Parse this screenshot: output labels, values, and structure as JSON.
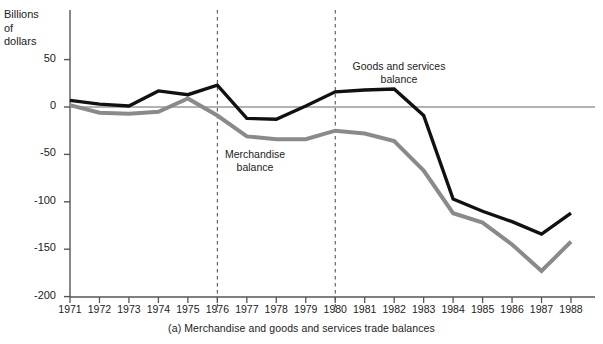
{
  "chart_data": {
    "type": "line",
    "title": "",
    "caption": "(a)  Merchandise and goods and services trade balances",
    "ylabel": "Billions\nof\ndollars",
    "xlabel": "",
    "ylim": [
      -200,
      75
    ],
    "xlim": [
      1971,
      1988
    ],
    "grid": false,
    "zero_line": true,
    "yticks": [
      50,
      0,
      -50,
      -100,
      -150,
      -200
    ],
    "ytick_labels": [
      "50",
      "0",
      "-50",
      "-100",
      "-150",
      "-200"
    ],
    "x": [
      1971,
      1972,
      1973,
      1974,
      1975,
      1976,
      1977,
      1978,
      1979,
      1980,
      1981,
      1982,
      1983,
      1984,
      1985,
      1986,
      1987,
      1988
    ],
    "xtick_labels": [
      "1971",
      "1972",
      "1973",
      "1974",
      "1975",
      "1976",
      "1977",
      "1978",
      "1979",
      "1980",
      "1981",
      "1982",
      "1983",
      "1984",
      "1985",
      "1986",
      "1987",
      "1988"
    ],
    "annotations": [
      {
        "type": "vline",
        "x": 1976,
        "style": "dashed"
      },
      {
        "type": "vline",
        "x": 1980,
        "style": "dashed"
      }
    ],
    "series": [
      {
        "name": "Goods and services balance",
        "label_text": "Goods and services\nbalance",
        "color": "#111111",
        "width": 3.4,
        "values": [
          7,
          3,
          1,
          17,
          13,
          23,
          -12,
          -13,
          1,
          16,
          18,
          19,
          -9,
          -97,
          -110,
          -121,
          -134,
          -112
        ]
      },
      {
        "name": "Merchandise balance",
        "label_text": "Merchandise\nbalance",
        "color": "#8a8a8a",
        "width": 4.0,
        "values": [
          2,
          -6,
          -7,
          -5,
          9,
          -9,
          -31,
          -34,
          -34,
          -25,
          -28,
          -36,
          -67,
          -112,
          -122,
          -145,
          -173,
          -142
        ]
      }
    ],
    "legend_position": "inline-annotation"
  },
  "colors": {
    "axis": "#555555",
    "goods_series": "#111111",
    "merchandise_series": "#8a8a8a",
    "zero_line": "#666666",
    "dashed_marker": "#444444",
    "text": "#222222",
    "background": "#ffffff"
  }
}
